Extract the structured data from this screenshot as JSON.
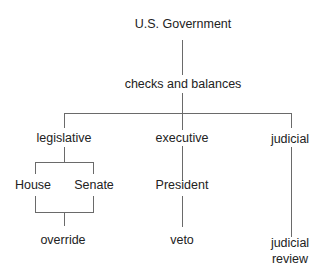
{
  "diagram": {
    "type": "tree",
    "root": {
      "label": "U.S. Government"
    },
    "principle": {
      "label": "checks and balances"
    },
    "branches": [
      {
        "label": "legislative",
        "children": [
          "House",
          "Senate"
        ],
        "power": "override"
      },
      {
        "label": "executive",
        "children": [
          "President"
        ],
        "power": "veto"
      },
      {
        "label": "judicial",
        "children": [],
        "power": "judicial review"
      }
    ],
    "colors": {
      "background": "#ffffff",
      "text": "#222222",
      "lines": "#6a6a6a"
    }
  },
  "labels": {
    "root": "U.S. Government",
    "principle": "checks and balances",
    "legislative": "legislative",
    "executive": "executive",
    "judicial": "judicial",
    "house": "House",
    "senate": "Senate",
    "president": "President",
    "override": "override",
    "veto": "veto",
    "judicial_review_line1": "judicial",
    "judicial_review_line2": "review"
  }
}
